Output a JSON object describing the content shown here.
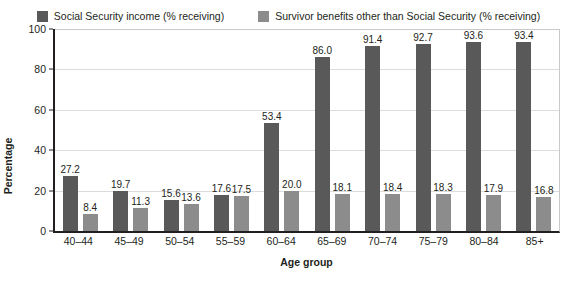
{
  "chart_data": {
    "type": "bar",
    "title": "",
    "xlabel": "Age group",
    "ylabel": "Percentage",
    "ylim": [
      0,
      100
    ],
    "yticks": [
      0,
      20,
      40,
      60,
      80,
      100
    ],
    "grid": true,
    "legend_position": "top-center",
    "categories": [
      "40–44",
      "45–49",
      "50–54",
      "55–59",
      "60–64",
      "65–69",
      "70–74",
      "75–79",
      "80–84",
      "85+"
    ],
    "series": [
      {
        "name": "Social Security income (% receiving)",
        "color": "#595959",
        "values": [
          27.2,
          19.7,
          15.6,
          17.6,
          53.4,
          86.0,
          91.4,
          92.7,
          93.6,
          93.4
        ],
        "labels": [
          "27.2",
          "19.7",
          "15.6",
          "17.6",
          "53.4",
          "86.0",
          "91.4",
          "92.7",
          "93.6",
          "93.4"
        ]
      },
      {
        "name": "Survivor benefits other than Social Security (% receiving)",
        "color": "#8c8c8c",
        "values": [
          8.4,
          11.3,
          13.6,
          17.5,
          20.0,
          18.1,
          18.4,
          18.3,
          17.9,
          16.8
        ],
        "labels": [
          "8.4",
          "11.3",
          "13.6",
          "17.5",
          "20.0",
          "18.1",
          "18.4",
          "18.3",
          "17.9",
          "16.8"
        ]
      }
    ]
  },
  "colors": {
    "series_1": "#595959",
    "series_2": "#8c8c8c",
    "axis": "#231f20",
    "gridline": "#dcdcdc",
    "background": "#ffffff"
  }
}
